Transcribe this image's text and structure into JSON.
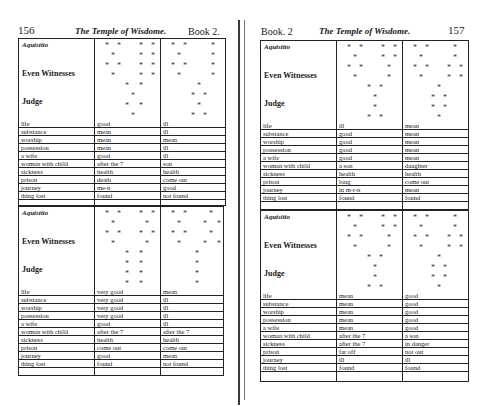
{
  "left_page": {
    "page_number": "156",
    "running_title": "The Temple of Wisdome.",
    "book_label": "Book 2.",
    "tables": [
      {
        "figure_labels": {
          "top": "Aquisitio",
          "middle": "Even Witnesses",
          "bottom": "Judge"
        },
        "houses": [
          "life",
          "substance",
          "worship",
          "possession",
          "a wife",
          "woman with child",
          "sickness",
          "prison",
          "journey",
          "thing lost"
        ],
        "col1": [
          "good",
          "mean",
          "mean",
          "mean",
          "good",
          "after the 7",
          "health",
          "death",
          "me-n",
          "found"
        ],
        "col2": [
          "ill",
          "ill",
          "mean",
          "ill",
          "ill",
          "son",
          "health",
          "come out",
          "good",
          "not found"
        ]
      },
      {
        "figure_labels": {
          "top": "Aquisitio",
          "middle": "Even Witnesses",
          "bottom": "Judge"
        },
        "houses": [
          "life",
          "substance",
          "worship",
          "possession",
          "a wife",
          "woman with child",
          "sickness",
          "prison",
          "journey",
          "thing lost"
        ],
        "col1": [
          "very good",
          "very good",
          "very good",
          "very good",
          "good",
          "after the 7",
          "health",
          "come out",
          "good",
          "found"
        ],
        "col2": [
          "mean",
          "ill",
          "ill",
          "ill",
          "ill",
          "after the 7",
          "health",
          "come out",
          "mean",
          "not found"
        ]
      }
    ]
  },
  "right_page": {
    "page_number": "157",
    "running_title": "The Temple of Wisdome.",
    "book_label": "Book. 2",
    "tables": [
      {
        "figure_labels": {
          "top": "Aquisitio",
          "middle": "Even Witnesses",
          "bottom": "Judge"
        },
        "houses": [
          "life",
          "substance",
          "worship",
          "possession",
          "a wife",
          "woman with child",
          "sickness",
          "prison",
          "journey",
          "thing lost"
        ],
        "col1": [
          "ill",
          "good",
          "good",
          "good",
          "good",
          "a son",
          "health",
          "long",
          "in m-r-n",
          "found"
        ],
        "col2": [
          "mean",
          "mean",
          "mean",
          "mean",
          "mean",
          "daughter",
          "health",
          "come out",
          "mean",
          "found"
        ]
      },
      {
        "figure_labels": {
          "top": "Aquisitio",
          "middle": "Even Witnesses",
          "bottom": "Judge"
        },
        "houses": [
          "life",
          "substance",
          "worship",
          "possession",
          "a wife",
          "woman with child",
          "sickness",
          "prison",
          "journey",
          "thing lost"
        ],
        "col1": [
          "mean",
          "mean",
          "mean",
          "mean",
          "mean",
          "after the 7",
          "after the 7",
          "far off",
          "ill",
          "found"
        ],
        "col2": [
          "good",
          "good",
          "good",
          "good",
          "good",
          "a son",
          "in danger",
          "not out",
          "ill",
          "found"
        ]
      }
    ]
  },
  "figure_glyph": "*",
  "colors": {
    "ink": "#1a1a1a",
    "paper": "#ffffff",
    "rule": "#222222"
  }
}
